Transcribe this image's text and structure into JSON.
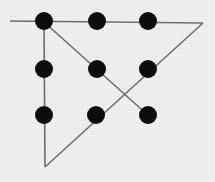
{
  "figure": {
    "canvas": {
      "width": 215,
      "height": 182
    },
    "background_color": "#e9e9e9",
    "dot_color": "#0d0d0d",
    "line_color": "#6d6d6d",
    "dot_radius": 9,
    "line_width": 1.6
  },
  "chart_data": {
    "type": "scatter",
    "title": "",
    "subtitle": "",
    "xlabel": "",
    "ylabel": "",
    "grid": false,
    "legend": "none",
    "xlim": [
      0,
      215
    ],
    "ylim": [
      182,
      0
    ],
    "points": [
      {
        "name": "top-left",
        "row": 0,
        "col": 0,
        "x": 44,
        "y": 21
      },
      {
        "name": "top-center",
        "row": 0,
        "col": 1,
        "x": 97,
        "y": 21
      },
      {
        "name": "top-right",
        "row": 0,
        "col": 2,
        "x": 148,
        "y": 21
      },
      {
        "name": "middle-left",
        "row": 1,
        "col": 0,
        "x": 44,
        "y": 69
      },
      {
        "name": "middle-center",
        "row": 1,
        "col": 1,
        "x": 97,
        "y": 69
      },
      {
        "name": "middle-right",
        "row": 1,
        "col": 2,
        "x": 148,
        "y": 69
      },
      {
        "name": "bottom-left",
        "row": 2,
        "col": 0,
        "x": 44,
        "y": 115
      },
      {
        "name": "bottom-center",
        "row": 2,
        "col": 1,
        "x": 96,
        "y": 115
      },
      {
        "name": "bottom-right",
        "row": 2,
        "col": 2,
        "x": 148,
        "y": 115
      }
    ],
    "vertices": [
      {
        "name": "apex-bottom",
        "x": 45,
        "y": 167
      },
      {
        "name": "apex-top-right",
        "x": 203,
        "y": 23
      },
      {
        "name": "horizontal-left-end",
        "x": 10,
        "y": 21
      }
    ],
    "segments": [
      {
        "name": "horizontal-top-edge",
        "x1": 10,
        "y1": 21,
        "x2": 203,
        "y2": 23
      },
      {
        "name": "vertical-left-edge",
        "x1": 44,
        "y1": 21,
        "x2": 45,
        "y2": 167
      },
      {
        "name": "diagonal-down-right",
        "x1": 44,
        "y1": 22,
        "x2": 150,
        "y2": 117
      },
      {
        "name": "diagonal-up-right",
        "x1": 45,
        "y1": 167,
        "x2": 203,
        "y2": 23
      }
    ]
  }
}
